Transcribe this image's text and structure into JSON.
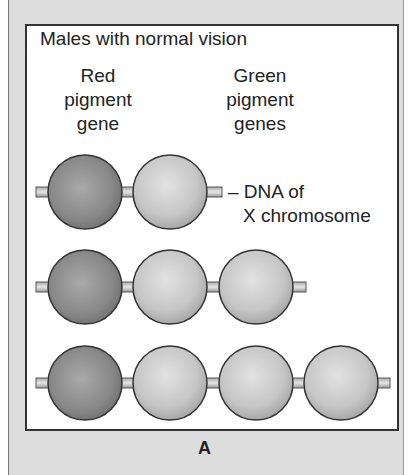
{
  "figure": {
    "title": "Males with normal vision",
    "labels": {
      "red_gene": [
        "Red",
        "pigment",
        "gene"
      ],
      "green_genes": [
        "Green",
        "pigment",
        "genes"
      ],
      "dna": [
        "– DNA of",
        "X chromosome"
      ]
    },
    "panel_letter": "A",
    "rows": [
      {
        "genes": [
          "red",
          "green"
        ]
      },
      {
        "genes": [
          "red",
          "green",
          "green"
        ]
      },
      {
        "genes": [
          "red",
          "green",
          "green",
          "green"
        ]
      }
    ],
    "colors": {
      "red_gene": "#8a8a8a",
      "green_gene": "#c8c8c8",
      "background": "#dcdcdc",
      "panel": "#ffffff"
    }
  }
}
